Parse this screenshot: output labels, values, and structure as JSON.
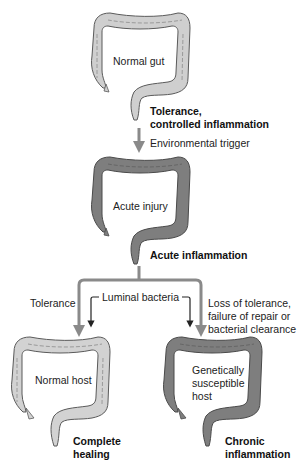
{
  "diagram": {
    "type": "flow",
    "stages": [
      {
        "id": "normal_gut",
        "organ_label": "Normal gut",
        "state_label_line1": "Tolerance,",
        "state_label_line2": "controlled inflammation",
        "fill": "#cfcfcf"
      },
      {
        "id": "acute_injury",
        "organ_label": "Acute injury",
        "state_label": "Acute inflammation",
        "fill": "#7e7e7e"
      },
      {
        "id": "normal_host",
        "organ_label": "Normal host",
        "state_label_line1": "Complete",
        "state_label_line2": "healing",
        "fill": "#d2d2d2"
      },
      {
        "id": "susceptible_host",
        "organ_label_line1": "Genetically",
        "organ_label_line2": "susceptible",
        "organ_label_line3": "host",
        "state_label_line1": "Chronic",
        "state_label_line2": "inflammation",
        "fill": "#7e7e7e"
      }
    ],
    "arrows": {
      "trigger": "Environmental trigger",
      "left_branch": "Tolerance",
      "center_input": "Luminal bacteria",
      "right_branch_line1": "Loss of tolerance,",
      "right_branch_line2": "failure of repair or",
      "right_branch_line3": "bacterial clearance"
    },
    "colors": {
      "light_colon": "#cfcfcf",
      "dark_colon": "#7e7e7e",
      "outline": "#5a5a5a",
      "arrow": "#8a8a8a",
      "thin_arrow": "#222222"
    }
  }
}
